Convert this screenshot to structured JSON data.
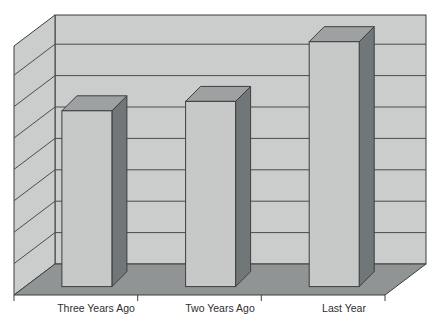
{
  "chart_data": {
    "type": "bar",
    "style": "3d-column",
    "title": "",
    "categories": [
      "Three Years Ago",
      "Two Years Ago",
      "Last Year"
    ],
    "values": [
      5.6,
      5.9,
      7.8
    ],
    "value_axis": {
      "labels_visible": false,
      "major_gridlines": 7,
      "units_per_gridline": 1,
      "min": 0,
      "max": 7.9
    },
    "category_axis": {
      "tick_count": 4
    },
    "legend": "none",
    "grid": "on",
    "colors": {
      "background": "#ffffff",
      "wall": "#cbcdcc",
      "floor": "#909494",
      "bar_front": "#c6c9c8",
      "bar_side": "#717678",
      "bar_top": "#9da1a2",
      "line": "#3c3e3f",
      "gridline": "#4a4c4d",
      "label_text": "#2e2e2e"
    }
  }
}
